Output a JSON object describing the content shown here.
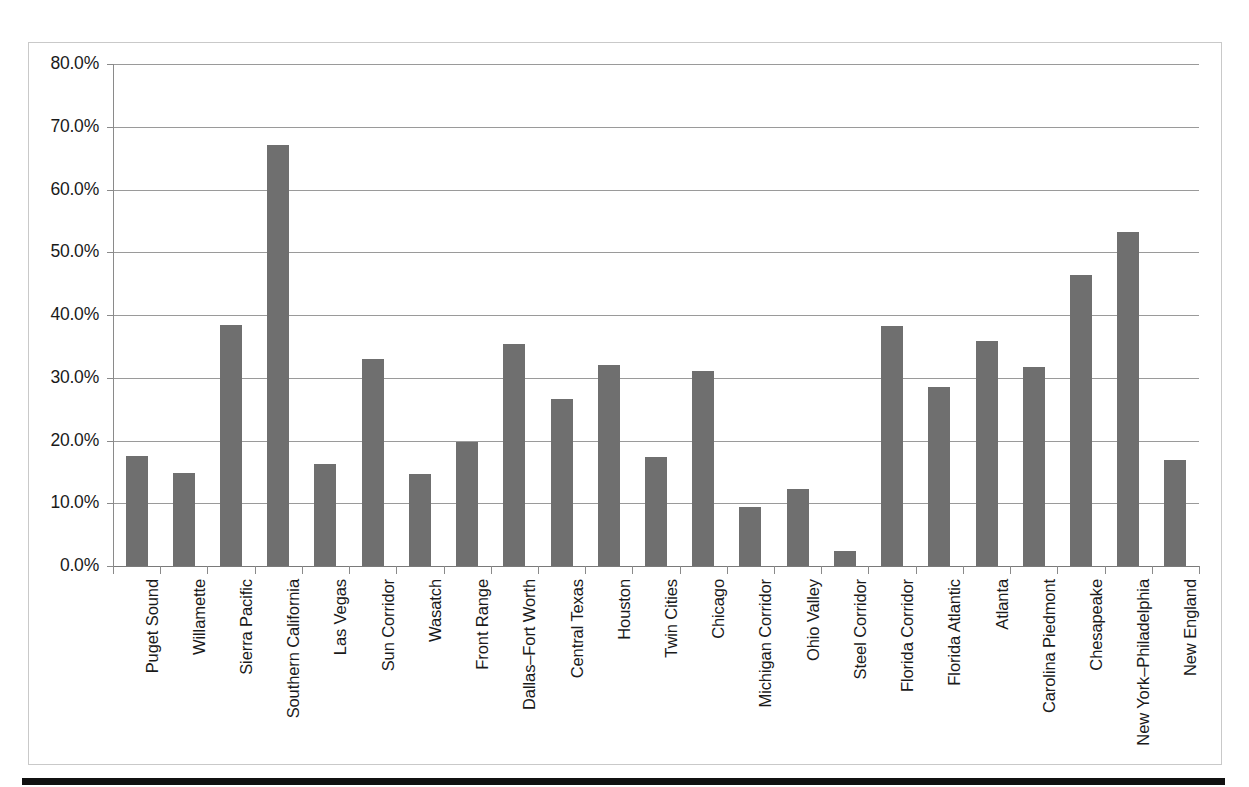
{
  "figure": {
    "frame_border_color": "#c9c9c9",
    "rule_color": "#111111",
    "bar_color": "#6f6f6f",
    "gridline_color": "#9a9a9a"
  },
  "chart_data": {
    "type": "bar",
    "title": "",
    "subtitle": "",
    "xlabel": "",
    "ylabel": "",
    "ylim": [
      0,
      80
    ],
    "y_tick_labels": [
      "0.0%",
      "10.0%",
      "20.0%",
      "30.0%",
      "40.0%",
      "50.0%",
      "60.0%",
      "70.0%",
      "80.0%"
    ],
    "y_tick_values": [
      0,
      10,
      20,
      30,
      40,
      50,
      60,
      70,
      80
    ],
    "grid": true,
    "legend": false,
    "legend_position": "none",
    "value_suffix": "%",
    "categories": [
      "Puget Sound",
      "Willamette",
      "Sierra Pacific",
      "Southern California",
      "Las Vegas",
      "Sun Corridor",
      "Wasatch",
      "Front Range",
      "Dallas–Fort Worth",
      "Central Texas",
      "Houston",
      "Twin Cities",
      "Chicago",
      "Michigan Corridor",
      "Ohio Valley",
      "Steel Corridor",
      "Florida Corridor",
      "Florida Atlantic",
      "Atlanta",
      "Carolina Piedmont",
      "Chesapeake",
      "New York–Philadelphia",
      "New England"
    ],
    "values": [
      17.5,
      14.8,
      38.4,
      67.1,
      16.3,
      33.0,
      14.6,
      19.8,
      35.4,
      26.6,
      32.0,
      17.4,
      31.1,
      9.4,
      12.2,
      2.4,
      38.3,
      28.5,
      35.8,
      31.7,
      46.3,
      53.3,
      16.9
    ]
  }
}
